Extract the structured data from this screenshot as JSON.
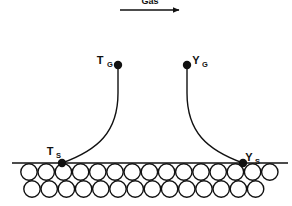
{
  "figure": {
    "background_color": "#ffffff",
    "line_color": "#111111",
    "width": 292,
    "height": 206
  },
  "flow": {
    "label": "Gas",
    "arrow_direction": "right",
    "arrow_x_start": 120,
    "arrow_x_end": 181,
    "arrow_y": 10,
    "label_x": 150,
    "label_y": 2
  },
  "labels": {
    "temperature_gas": {
      "symbol": "T",
      "subscript": "G",
      "x": 101,
      "y": 61,
      "anchor_point_x": 118,
      "anchor_point_y": 65
    },
    "mass_fraction_gas": {
      "symbol": "Y",
      "subscript": "G",
      "x": 194,
      "y": 61,
      "anchor_point_x": 187,
      "anchor_point_y": 65
    },
    "temperature_surface": {
      "symbol": "T",
      "subscript": "S",
      "x": 48,
      "y": 152,
      "anchor_point_x": 62,
      "anchor_point_y": 163
    },
    "mass_fraction_surface": {
      "symbol": "Y",
      "subscript": "S",
      "x": 240,
      "y": 158,
      "anchor_point_x": 243,
      "anchor_point_y": 163
    }
  },
  "curves": {
    "temperature_profile": {
      "name": "T profile",
      "path": "M 118 65 L 118 95 C 118 130 100 150 62 163",
      "start": [
        118,
        65
      ],
      "end": [
        62,
        163
      ]
    },
    "mass_fraction_profile": {
      "name": "Y profile",
      "path": "M 187 65 L 187 95 C 187 130 205 150 243 163",
      "start": [
        187,
        65
      ],
      "end": [
        243,
        163
      ]
    }
  },
  "surface_line": {
    "x_start": 12,
    "x_end": 288,
    "y": 163
  },
  "particle_bed": {
    "description": "Two staggered rows of open circles representing packed solid particles",
    "circle_radius": 8.2,
    "row1": {
      "y": 172,
      "x_start": 29,
      "spacing": 17.2,
      "count": 15
    },
    "row2": {
      "y": 189,
      "x_start": 32,
      "spacing": 17.2,
      "count": 14
    }
  },
  "dots": [
    {
      "name": "T_G endpoint",
      "x": 118,
      "y": 65,
      "r": 4.2
    },
    {
      "name": "Y_G endpoint",
      "x": 187,
      "y": 65,
      "r": 4.2
    },
    {
      "name": "T_S endpoint",
      "x": 62,
      "y": 163,
      "r": 4.2
    },
    {
      "name": "Y_S endpoint",
      "x": 243,
      "y": 163,
      "r": 4.2
    }
  ]
}
